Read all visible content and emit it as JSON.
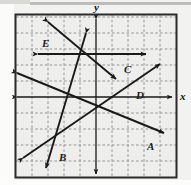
{
  "figure": {
    "type": "coordinate-plane-graph",
    "background_color": "#f2f2f0",
    "frame_color": "#2b2b2b",
    "grid_color": "#8a8a96",
    "line_color": "#1a1a1a",
    "width": 191,
    "height": 185
  },
  "axes": {
    "x_label": "x",
    "y_label": "y",
    "origin_px": {
      "x": 96,
      "y": 97
    },
    "grid_spacing_px": 16,
    "x_range": [
      -5,
      5
    ],
    "y_range": [
      -5,
      5
    ],
    "grid_visible": true,
    "tick_labels_visible": false
  },
  "frame": {
    "left": 15,
    "top": 14,
    "right": 177,
    "bottom": 178
  },
  "lines": [
    {
      "id": "A",
      "label": "A",
      "label_px": {
        "x": 147,
        "y": 141
      },
      "start_px": {
        "x": 17,
        "y": 73
      },
      "end_px": {
        "x": 164,
        "y": 133
      },
      "arrow_both_ends": true,
      "description": "line A, shallow negative slope from upper-left to lower-right"
    },
    {
      "id": "B",
      "label": "B",
      "label_px": {
        "x": 59,
        "y": 152
      },
      "start_px": {
        "x": 86,
        "y": 33
      },
      "end_px": {
        "x": 46,
        "y": 168
      },
      "arrow_both_ends": true,
      "description": "line B, steep negative slope running top to bottom-left"
    },
    {
      "id": "C",
      "label": "C",
      "label_px": {
        "x": 124,
        "y": 64
      },
      "start_px": {
        "x": 38,
        "y": 54
      },
      "end_px": {
        "x": 146,
        "y": 54
      },
      "arrow_both_ends": true,
      "description": "line C, horizontal line above the x-axis"
    },
    {
      "id": "D",
      "label": "D",
      "label_px": {
        "x": 136,
        "y": 90
      },
      "start_px": {
        "x": 23,
        "y": 158
      },
      "end_px": {
        "x": 160,
        "y": 64
      },
      "arrow_both_ends": true,
      "description": "line D, positive slope from lower-left to upper-right"
    },
    {
      "id": "E",
      "label": "E",
      "label_px": {
        "x": 42,
        "y": 38
      },
      "start_px": {
        "x": 48,
        "y": 22
      },
      "end_px": {
        "x": 116,
        "y": 79
      },
      "arrow_both_ends": true,
      "description": "line E, negative slope from upper-left toward lower-right"
    }
  ]
}
